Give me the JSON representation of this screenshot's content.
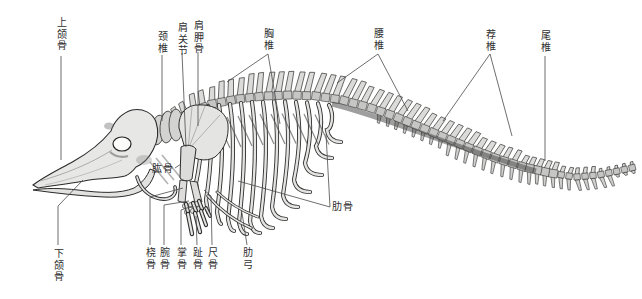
{
  "labels": {
    "upper_jaw": "上颌骨",
    "lower_jaw": "下颌骨",
    "cervical": "颈椎",
    "shoulder_joint": "肩关节",
    "scapula": "肩胛骨",
    "thoracic": "胸椎",
    "lumbar": "腰椎",
    "sacral": "荐椎",
    "caudal": "尾椎",
    "humerus": "肱骨",
    "radius": "桡骨",
    "carpal": "腕骨",
    "metacarpal": "掌骨",
    "phalanx": "趾骨",
    "ulna": "尺骨",
    "costal_arch": "肋弓",
    "rib": "肋骨"
  },
  "colors": {
    "background": "#ffffff",
    "bone_fill": "#e6e6e4",
    "bone_outline": "#2b2b2b",
    "callout_line": "#4a4a4a",
    "label_text": "#2f2f2f"
  }
}
